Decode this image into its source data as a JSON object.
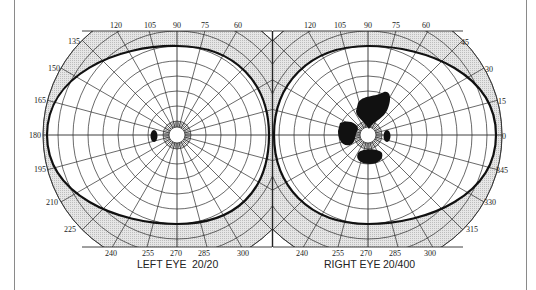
{
  "figure": {
    "type": "visual-field-perimetry-chart",
    "colors": {
      "background": "#ffffff",
      "grid": "#2a2a2a",
      "shaded_band": "#d9d9d9",
      "isopter": "#111111",
      "scotoma": "#111111",
      "frame": "#8a8a8a"
    },
    "left_eye": {
      "caption": "LEFT EYE",
      "acuity": "20/20",
      "center": [
        177,
        135
      ],
      "outer_radius": 134,
      "top_labels": [
        "120",
        "105",
        "90",
        "75",
        "60"
      ],
      "left_labels": [
        "135",
        "150",
        "165",
        "180",
        "195",
        "210",
        "225"
      ],
      "bottom_labels": [
        "240",
        "255",
        "270",
        "285",
        "300"
      ],
      "scotomas": [
        "blind-spot"
      ]
    },
    "right_eye": {
      "caption": "RIGHT EYE",
      "acuity": "20/400",
      "center": [
        368,
        135
      ],
      "outer_radius": 134,
      "top_labels": [
        "120",
        "105",
        "90",
        "75",
        "60"
      ],
      "right_labels": [
        "45",
        "30",
        "15",
        "0",
        "345",
        "330",
        "315"
      ],
      "bottom_labels": [
        "240",
        "255",
        "270",
        "285",
        "300"
      ],
      "scotomas": [
        "superior-central",
        "nasal-left",
        "blind-spot",
        "inferior-central"
      ]
    }
  }
}
